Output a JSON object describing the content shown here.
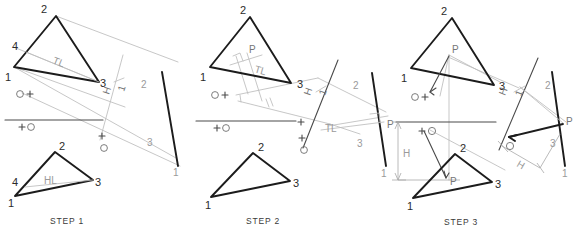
{
  "figure": {
    "background": "#ffffff",
    "line_colors": {
      "object_heavy": "#1c1c1c",
      "construction_light": "#bdbdbd",
      "dimension": "#a8a8a8",
      "text": "#2b2b2b",
      "text_gray": "#9a9a9a"
    }
  },
  "panels": [
    {
      "id": "step-1",
      "caption": "STEP 1",
      "top_view": {
        "name": "horizontal-view-triangle",
        "vertex_labels": [
          "2",
          "4",
          "1",
          "3"
        ],
        "annotations": [
          "TL"
        ],
        "point_labels": [
          "O+",
          "+O"
        ]
      },
      "aux_view": {
        "name": "auxiliary-edge-view",
        "fold_line_label_1": "H",
        "fold_line_label_2": "1",
        "vertex_labels": [
          "2",
          "3",
          "1"
        ],
        "point_label": "+O",
        "o_label": "O"
      },
      "front_view": {
        "name": "frontal-view-triangle",
        "vertex_labels": [
          "2",
          "4",
          "1",
          "3"
        ],
        "annotations": [
          "HL"
        ]
      }
    },
    {
      "id": "step-2",
      "caption": "STEP 2",
      "top_view": {
        "name": "horizontal-view-triangle",
        "vertex_labels": [
          "2",
          "1",
          "3"
        ],
        "annotations": [
          "P",
          "TL"
        ],
        "point_labels": [
          "O+",
          "+O"
        ],
        "tick_mark": "//"
      },
      "aux_view": {
        "name": "auxiliary-edge-view",
        "fold_line_label_1": "H",
        "fold_line_label_2": "1",
        "vertex_labels": [
          "2",
          "3",
          "1"
        ],
        "annotations": [
          "TL",
          "P"
        ],
        "o_label": "O"
      },
      "front_view": {
        "name": "frontal-view-triangle",
        "vertex_labels": [
          "2",
          "1",
          "3"
        ]
      }
    },
    {
      "id": "step-3",
      "caption": "STEP 3",
      "top_view": {
        "name": "horizontal-view-triangle",
        "vertex_labels": [
          "2",
          "1",
          "3"
        ],
        "annotations": [
          "P"
        ],
        "point_labels": [
          "O+"
        ]
      },
      "aux_view": {
        "name": "auxiliary-edge-view",
        "fold_line_label_1": "H",
        "fold_line_label_2": "1",
        "vertex_labels": [
          "2",
          "3",
          "1"
        ],
        "annotations": [
          "P",
          "H"
        ],
        "o_label": "O"
      },
      "front_view": {
        "name": "frontal-view-triangle",
        "vertex_labels": [
          "2",
          "1",
          "3"
        ],
        "annotations": [
          "P",
          "H"
        ],
        "point_labels": [
          "+O"
        ]
      }
    }
  ],
  "labels": {
    "tl": "TL",
    "hl": "HL",
    "p": "P",
    "h": "H",
    "o": "O",
    "o_plus": "O+",
    "plus_o": "+O",
    "fold_h": "H",
    "fold_1": "1",
    "parallel_tick": "//",
    "v1": "1",
    "v2": "2",
    "v3": "3",
    "v4": "4",
    "step1": "STEP 1",
    "step2": "STEP 2",
    "step3": "STEP 3"
  }
}
